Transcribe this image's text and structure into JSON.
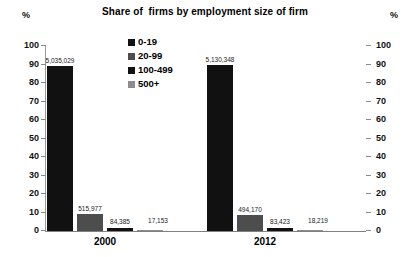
{
  "chart_data": {
    "type": "bar",
    "title": "Share of  firms by employment size of firm",
    "xlabel": "",
    "ylabel": "%",
    "ylabel_right": "%",
    "ylim": [
      0,
      100
    ],
    "ytick_labels": [
      "100",
      "90",
      "80",
      "70",
      "60",
      "50",
      "40",
      "30",
      "20",
      "10",
      "0"
    ],
    "ytick_values": [
      100,
      90,
      80,
      70,
      60,
      50,
      40,
      30,
      20,
      10,
      0
    ],
    "grid": false,
    "legend_position": "inside-top-center",
    "categories": [
      "2000",
      "2012"
    ],
    "series": [
      {
        "name": "0-19",
        "color": "#111111",
        "values": [
          89.2,
          89.8
        ],
        "labels": [
          "5,035,029",
          "5,130,348"
        ]
      },
      {
        "name": "20-99",
        "color": "#4d4d4d",
        "values": [
          9.1,
          8.7
        ],
        "labels": [
          "515,977",
          "494,170"
        ]
      },
      {
        "name": "100-499",
        "color": "#111111",
        "values": [
          1.5,
          1.5
        ],
        "labels": [
          "84,385",
          "83,423"
        ]
      },
      {
        "name": "500+",
        "color": "#8c8c8c",
        "values": [
          0.3,
          0.3
        ],
        "labels": [
          "17,153",
          "18,219"
        ]
      }
    ]
  },
  "axis": {
    "left_unit": "%",
    "right_unit": "%"
  }
}
